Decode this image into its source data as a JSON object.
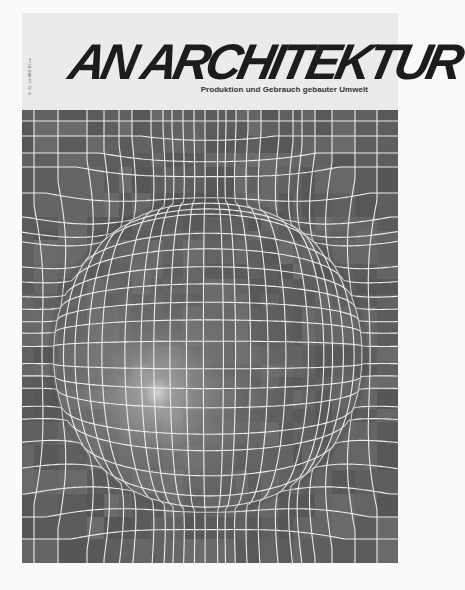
{
  "magazine": {
    "title": "AN ARCHITEKTUR",
    "subtitle": "Produktion und Gebrauch gebauter Umwelt",
    "issue_info": "Nr. 23, Juli 2010, 8 Euro"
  },
  "artwork": {
    "description": "distorted-grid-sphere",
    "background_color": "#616161",
    "line_color": "#ececec",
    "highlight_color": "#cfcfcf",
    "width": 376,
    "height": 453,
    "sphere": {
      "cx": 186,
      "cy": 245,
      "r": 158
    },
    "highlight": {
      "cx": 136,
      "cy": 283
    },
    "vertical_lines": [
      12,
      36,
      65,
      82,
      97,
      110,
      129,
      141,
      161,
      183,
      214,
      226,
      239,
      257,
      271,
      280,
      293,
      310,
      333,
      355
    ],
    "horizontal_lines": [
      11,
      26,
      43,
      57,
      83,
      107,
      121,
      130,
      154,
      169,
      184,
      197,
      236,
      254,
      267,
      280,
      299,
      312,
      335,
      360,
      384,
      407,
      429
    ]
  },
  "colors": {
    "page_background": "#fafafa",
    "cover_background": "#ebebeb",
    "logo": "#1c1c1c",
    "subtitle": "#333333"
  }
}
